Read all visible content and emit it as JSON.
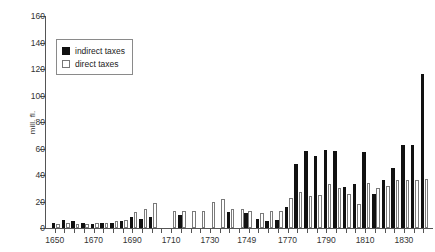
{
  "chart_data": {
    "type": "bar",
    "title": "",
    "subtitle": "",
    "xlabel": "",
    "ylabel": "mill. fl.",
    "ylim": [
      0,
      160
    ],
    "ytick_labels": [
      "160",
      "140",
      "120",
      "100",
      "80",
      "60",
      "40",
      "20",
      "0"
    ],
    "yticks": [
      160,
      140,
      120,
      100,
      80,
      60,
      40,
      20,
      0
    ],
    "xtick_labels": [
      "1650",
      "1670",
      "1690",
      "1710",
      "1730",
      "1749",
      "1770",
      "1790",
      "1810",
      "1830"
    ],
    "xticks": [
      1650,
      1670,
      1690,
      1710,
      1730,
      1749,
      1770,
      1790,
      1810,
      1830
    ],
    "xlim": [
      1645,
      1845
    ],
    "grid": false,
    "legend_position": "upper-left",
    "legend": [
      "indirect taxes",
      "direct taxes"
    ],
    "series": [
      {
        "name": "indirect taxes",
        "color": "#111111",
        "x": [
          1650,
          1655,
          1660,
          1665,
          1670,
          1675,
          1680,
          1685,
          1690,
          1695,
          1700,
          1715,
          1740,
          1749,
          1755,
          1760,
          1765,
          1770,
          1775,
          1780,
          1785,
          1790,
          1795,
          1800,
          1805,
          1810,
          1815,
          1820,
          1825,
          1830,
          1835,
          1840
        ],
        "values": [
          4,
          6,
          5,
          4,
          3,
          4,
          4,
          5,
          8,
          7,
          8,
          10,
          12,
          11,
          7,
          5,
          6,
          16,
          48,
          58,
          54,
          59,
          58,
          31,
          33,
          57,
          26,
          36,
          45,
          63,
          63,
          116
        ]
      },
      {
        "name": "direct taxes",
        "color": "#ffffff",
        "x": [
          1650,
          1655,
          1660,
          1665,
          1670,
          1675,
          1680,
          1685,
          1690,
          1695,
          1700,
          1710,
          1715,
          1720,
          1725,
          1730,
          1735,
          1740,
          1745,
          1749,
          1755,
          1760,
          1765,
          1770,
          1775,
          1780,
          1785,
          1790,
          1795,
          1800,
          1805,
          1810,
          1815,
          1820,
          1825,
          1830,
          1835,
          1840
        ],
        "values": [
          3,
          4,
          3,
          3,
          4,
          4,
          5,
          6,
          12,
          14,
          19,
          13,
          13,
          13,
          13,
          20,
          22,
          14,
          14,
          13,
          11,
          13,
          13,
          23,
          27,
          24,
          25,
          33,
          30,
          26,
          18,
          34,
          30,
          32,
          36,
          36,
          36,
          37
        ]
      }
    ]
  }
}
